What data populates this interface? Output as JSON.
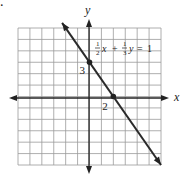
{
  "chart_data": {
    "type": "line",
    "title": "",
    "xlabel": "x",
    "ylabel": "y",
    "xlim": [
      -6,
      6
    ],
    "ylim": [
      -6,
      6
    ],
    "grid": true,
    "equation": {
      "coef_x": {
        "num": "1",
        "den": "2"
      },
      "var_x": "x",
      "plus": "+",
      "coef_y": {
        "num": "1",
        "den": "3"
      },
      "var_y": "y",
      "equals": "=",
      "rhs": "1"
    },
    "series": [
      {
        "name": "1/2 x + 1/3 y = 1",
        "x": [
          -2.3,
          6
        ],
        "y": [
          6.45,
          -6
        ]
      }
    ],
    "points": [
      {
        "x": 0,
        "y": 3,
        "label": "3"
      },
      {
        "x": 2,
        "y": 0,
        "label": "2"
      }
    ],
    "marker": "."
  }
}
